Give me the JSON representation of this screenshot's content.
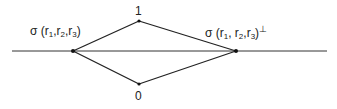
{
  "diagram": {
    "type": "lattice",
    "nodes": {
      "top": {
        "label": "1",
        "x": 139,
        "y": 21
      },
      "bottom": {
        "label": "0",
        "x": 139,
        "y": 84
      },
      "left": {
        "label": "σ(r1,r2,r3)",
        "x": 73,
        "y": 51
      },
      "right": {
        "label": "σ(r1,r2,r3)⊥",
        "x": 236,
        "y": 51
      }
    },
    "edges": [
      [
        "left",
        "top"
      ],
      [
        "left",
        "bottom"
      ],
      [
        "top",
        "right"
      ],
      [
        "bottom",
        "right"
      ]
    ],
    "axis_line": {
      "x1": 12,
      "x2": 327,
      "y": 51
    },
    "left_label": {
      "sigma": "σ",
      "open": " (r",
      "s1": "1",
      "c1": ",r",
      "s2": "2",
      "c2": ",r",
      "s3": "3",
      "close": ")"
    },
    "right_label": {
      "sigma": "σ",
      "open": " (r",
      "s1": "1",
      "c1": ", r",
      "s2": "2",
      "c2": ",r",
      "s3": "3",
      "close": ")",
      "perp": "⊥"
    },
    "top_label": "1",
    "bottom_label": "0",
    "colors": {
      "line": "#222222",
      "text": "#222222"
    }
  }
}
